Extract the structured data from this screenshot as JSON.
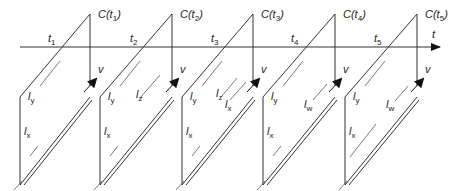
{
  "diagram": {
    "axis": {
      "label": "t",
      "y": 47,
      "x_start": 20,
      "x_end": 440
    },
    "velocity_label": "v",
    "frames": [
      {
        "id": "C(t1)",
        "label_main": "C(t",
        "label_sub": "1",
        "label_close": ")",
        "time_main": "t",
        "time_sub": "1",
        "x": 90,
        "segments": [
          {
            "name": "l",
            "sub": "y"
          },
          {
            "name": "l",
            "sub": "x"
          }
        ]
      },
      {
        "id": "C(t2)",
        "label_main": "C(t",
        "label_sub": "2",
        "label_close": ")",
        "time_main": "t",
        "time_sub": "2",
        "x": 172,
        "segments": [
          {
            "name": "l",
            "sub": "y"
          },
          {
            "name": "l",
            "sub": "z"
          },
          {
            "name": "l",
            "sub": "x"
          }
        ]
      },
      {
        "id": "C(t3)",
        "label_main": "C(t",
        "label_sub": "3",
        "label_close": ")",
        "time_main": "t",
        "time_sub": "3",
        "x": 253,
        "segments": [
          {
            "name": "l",
            "sub": "y"
          },
          {
            "name": "l",
            "sub": "z"
          },
          {
            "name": "l",
            "sub": "x"
          },
          {
            "name": "l",
            "sub": "x"
          }
        ]
      },
      {
        "id": "C(t4)",
        "label_main": "C(t",
        "label_sub": "4",
        "label_close": ")",
        "time_main": "t",
        "time_sub": "4",
        "x": 335,
        "segments": [
          {
            "name": "l",
            "sub": "y"
          },
          {
            "name": "l",
            "sub": "w"
          },
          {
            "name": "l",
            "sub": "x"
          }
        ]
      },
      {
        "id": "C(t5)",
        "label_main": "C(t",
        "label_sub": "5",
        "label_close": ")",
        "time_main": "t",
        "time_sub": "5",
        "x": 417,
        "segments": [
          {
            "name": "l",
            "sub": "y"
          },
          {
            "name": "l",
            "sub": "w"
          },
          {
            "name": "l",
            "sub": "x"
          }
        ]
      }
    ]
  }
}
